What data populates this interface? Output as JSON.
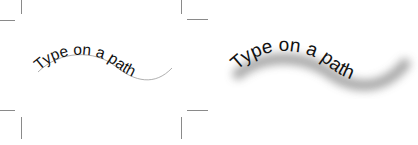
{
  "left_panel": {
    "text": "Type on a path",
    "path_visible": true,
    "crop_marks": true
  },
  "right_panel": {
    "text": "Type on a path",
    "effect": "drop-shadow",
    "shadow_color": "#9a9a9a"
  },
  "colors": {
    "text": "#111111",
    "path": "#9a9a9a",
    "crop_marks": "#8a8a8a",
    "background": "#ffffff"
  }
}
